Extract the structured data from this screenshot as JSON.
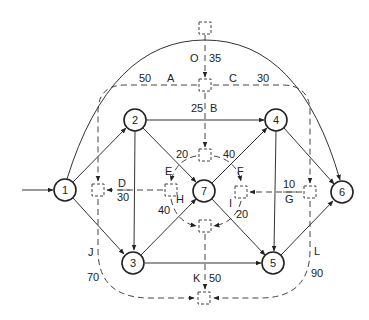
{
  "diagram": {
    "type": "activity network (activity-on-arrow with dummy/dashed activity-on-node overlay)",
    "nodes": [
      {
        "id": "1",
        "label": "1"
      },
      {
        "id": "2",
        "label": "2"
      },
      {
        "id": "3",
        "label": "3"
      },
      {
        "id": "4",
        "label": "4"
      },
      {
        "id": "5",
        "label": "5"
      },
      {
        "id": "6",
        "label": "6"
      },
      {
        "id": "7",
        "label": "7"
      }
    ],
    "solid_edges": [
      {
        "from": "input",
        "to": "1"
      },
      {
        "from": "1",
        "to": "2"
      },
      {
        "from": "1",
        "to": "3"
      },
      {
        "from": "1",
        "to": "6"
      },
      {
        "from": "2",
        "to": "4"
      },
      {
        "from": "2",
        "to": "3"
      },
      {
        "from": "2",
        "to": "7"
      },
      {
        "from": "3",
        "to": "7"
      },
      {
        "from": "3",
        "to": "5"
      },
      {
        "from": "7",
        "to": "4"
      },
      {
        "from": "7",
        "to": "5"
      },
      {
        "from": "4",
        "to": "5"
      },
      {
        "from": "4",
        "to": "6"
      },
      {
        "from": "5",
        "to": "6"
      }
    ],
    "dashed_activities": [
      {
        "letter": "O",
        "value": "35"
      },
      {
        "letter": "A",
        "value": "50"
      },
      {
        "letter": "C",
        "value": "30"
      },
      {
        "letter": "B",
        "value": "25"
      },
      {
        "letter": "D",
        "value": "30"
      },
      {
        "letter": "E",
        "value": "20"
      },
      {
        "letter": "F",
        "value": "40"
      },
      {
        "letter": "G",
        "value": "10"
      },
      {
        "letter": "H",
        "value": "40"
      },
      {
        "letter": "I",
        "value": "20"
      },
      {
        "letter": "J",
        "value": "70"
      },
      {
        "letter": "K",
        "value": "50"
      },
      {
        "letter": "L",
        "value": "90"
      }
    ]
  },
  "labels": {
    "O": "O",
    "O_val": "35",
    "A": "A",
    "A_val": "50",
    "C": "C",
    "C_val": "30",
    "B": "B",
    "B_val": "25",
    "D": "D",
    "D_val": "30",
    "E": "E",
    "E_val": "20",
    "F": "F",
    "F_val": "40",
    "G": "G",
    "G_val": "10",
    "H": "H",
    "H_val": "40",
    "I": "I",
    "I_val": "20",
    "J": "J",
    "J_val": "70",
    "K": "K",
    "K_val": "50",
    "L": "L",
    "L_val": "90"
  }
}
